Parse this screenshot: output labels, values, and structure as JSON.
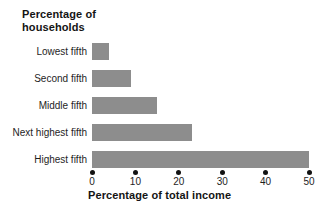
{
  "chart": {
    "title_line1": "Percentage of",
    "title_line2": "households",
    "bar_color": "#8d8d8d",
    "dot_color": "#121212",
    "text_color": "#1e1e1e"
  },
  "chart_data": {
    "type": "bar",
    "orientation": "horizontal",
    "title": "Percentage of households",
    "xlabel": "Percentage of total income",
    "categories": [
      "Lowest fifth",
      "Second fifth",
      "Middle fifth",
      "Next highest fifth",
      "Highest fifth"
    ],
    "values": [
      4,
      9,
      15,
      23,
      50
    ],
    "xlim": [
      0,
      50
    ],
    "xticks": [
      0,
      10,
      20,
      30,
      40,
      50
    ],
    "grid": false,
    "legend": false,
    "tick_style": "dot"
  }
}
